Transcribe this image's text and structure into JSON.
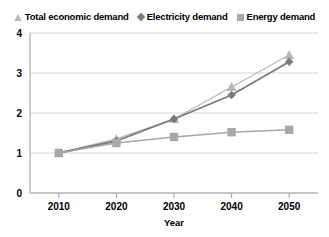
{
  "legend": {
    "position": "top",
    "entries": [
      {
        "label": "Total economic demand",
        "marker": "triangle-icon",
        "color": "#b9b9b9"
      },
      {
        "label": "Electricity demand",
        "marker": "diamond-icon",
        "color": "#7a7a7a"
      },
      {
        "label": "Energy demand",
        "marker": "square-icon",
        "color": "#a8a8a8"
      }
    ]
  },
  "axes": {
    "x": {
      "title": "Year",
      "ticks": [
        "2010",
        "2020",
        "2030",
        "2040",
        "2050"
      ]
    },
    "y": {
      "title": "",
      "ticks": [
        "0",
        "1",
        "2",
        "3",
        "4"
      ]
    }
  },
  "chart_data": {
    "type": "line",
    "title": "",
    "xlabel": "Year",
    "ylabel": "",
    "x": [
      2010,
      2020,
      2030,
      2040,
      2050
    ],
    "categories": [
      "2010",
      "2020",
      "2030",
      "2040",
      "2050"
    ],
    "xlim": [
      2005,
      2055
    ],
    "ylim": [
      0,
      4
    ],
    "grid": true,
    "legend_position": "top",
    "series": [
      {
        "name": "Total economic demand",
        "marker": "triangle",
        "color": "#b9b9b9",
        "values": [
          1.0,
          1.35,
          1.85,
          2.65,
          3.45
        ]
      },
      {
        "name": "Electricity demand",
        "marker": "diamond",
        "color": "#7a7a7a",
        "values": [
          1.0,
          1.3,
          1.85,
          2.45,
          3.28
        ]
      },
      {
        "name": "Energy demand",
        "marker": "square",
        "color": "#a8a8a8",
        "values": [
          1.0,
          1.25,
          1.4,
          1.52,
          1.58
        ]
      }
    ]
  }
}
